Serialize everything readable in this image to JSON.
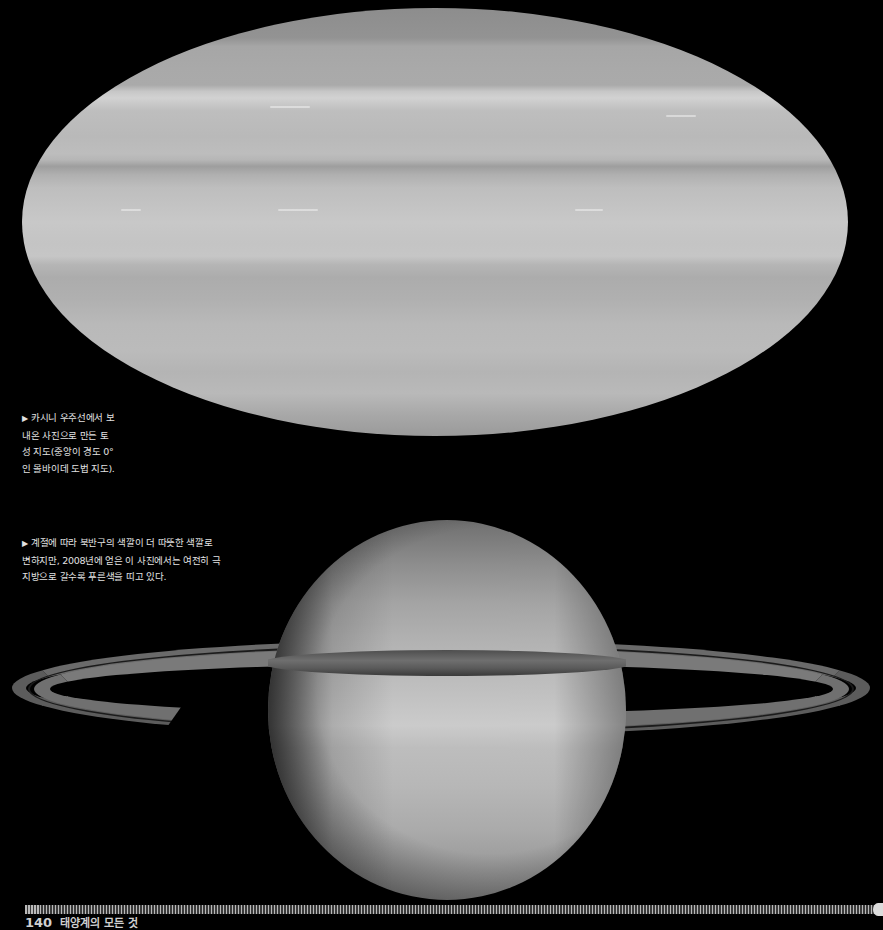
{
  "figures": {
    "map": {
      "subject": "Saturn Mollweide map",
      "caption": "카시니 우주선에서 보내온 사진으로 만든 토성 지도(중앙이 경도 0°인 몰바이데 도법 지도).",
      "caption_lines": [
        "카시니 우주선에서 보",
        "내온 사진으로 만든 토",
        "성 지도(중앙이 경도 0°",
        "인 몰바이데 도법 지도)."
      ]
    },
    "photo": {
      "subject": "Saturn with rings (2008)",
      "caption": "계절에 따라 북반구의 색깔이 더 따뜻한 색깔로 변하지만, 2008년에 얻은 이 사진에서는 여전히 극 지방으로 갈수록 푸른색을 띠고 있다.",
      "caption_lines": [
        "계절에 따라 북반구의 색깔이 더 따뜻한 색깔로",
        "변하지만, 2008년에 얻은 이 사진에서는 여전히 극",
        "지방으로 갈수록 푸른색을 띠고 있다."
      ]
    },
    "caption_marker": "▶"
  },
  "footer": {
    "page_number": "140",
    "book_title": "태양계의 모든 것"
  },
  "colors": {
    "background": "#000000",
    "caption_text": "#e2e2e2"
  }
}
